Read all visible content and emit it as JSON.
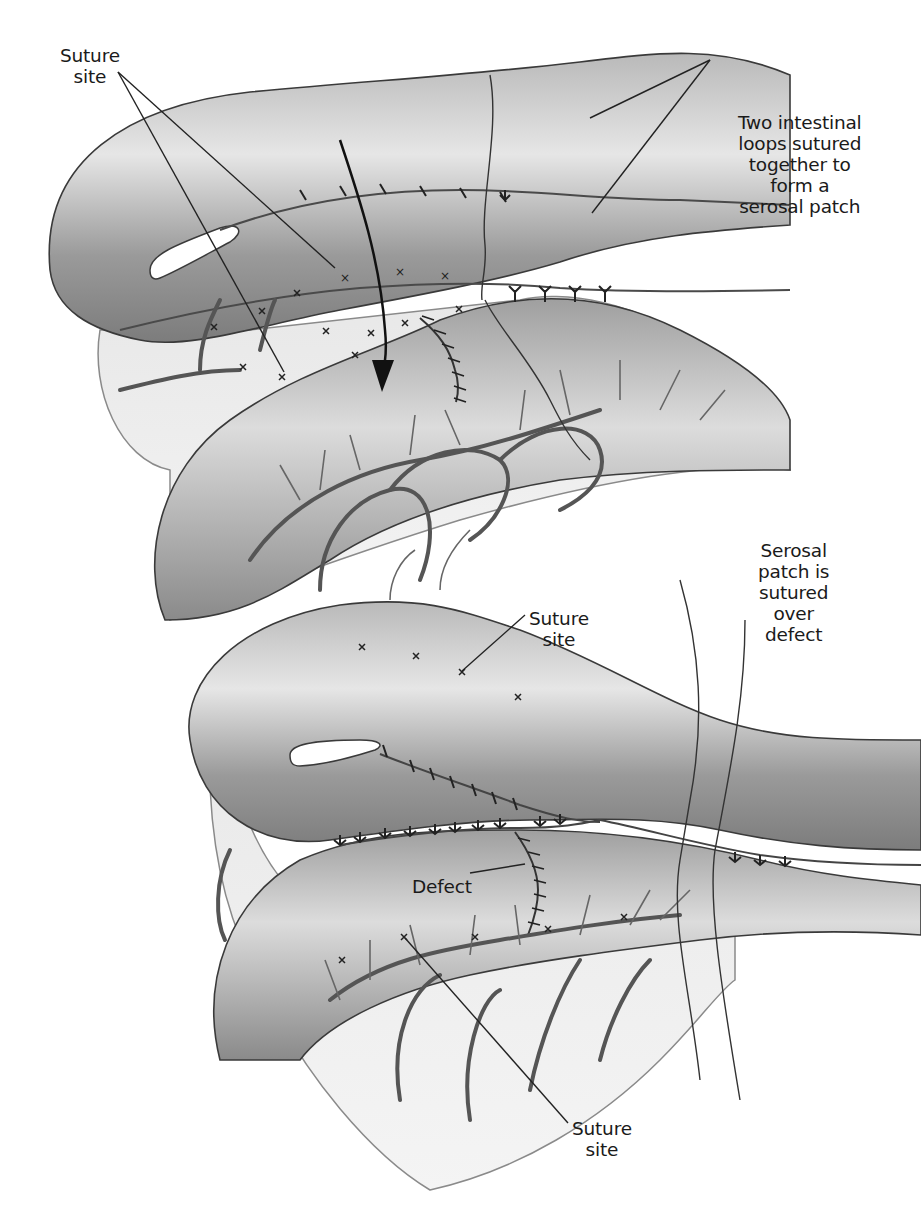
{
  "figure": {
    "type": "surgical illustration",
    "panels": [
      {
        "id": "top",
        "description": "Two intestinal loops sutured together; arrow indicates the patch is folded down over the defect",
        "labels": [
          {
            "id": "suture_site_top",
            "lines": [
              "Suture",
              "site"
            ]
          },
          {
            "id": "two_loops",
            "lines": [
              "Two intestinal",
              "loops sutured",
              "together to",
              "form a",
              "serosal patch"
            ]
          }
        ]
      },
      {
        "id": "bottom",
        "description": "Serosal patch sutured over the defect",
        "labels": [
          {
            "id": "suture_site_mid",
            "lines": [
              "Suture",
              "site"
            ]
          },
          {
            "id": "serosal_patch",
            "lines": [
              "Serosal",
              "patch is",
              "sutured",
              "over",
              "defect"
            ]
          },
          {
            "id": "defect",
            "lines": [
              "Defect"
            ]
          },
          {
            "id": "suture_site_bottom",
            "lines": [
              "Suture",
              "site"
            ]
          }
        ]
      }
    ],
    "colors": {
      "outline": "#3a3a3a",
      "tissue_light": "#d9d9d9",
      "tissue_mid": "#a8a8a8",
      "tissue_dark": "#6e6e6e",
      "vessel": "#555555",
      "text": "#1a1a1a"
    }
  }
}
